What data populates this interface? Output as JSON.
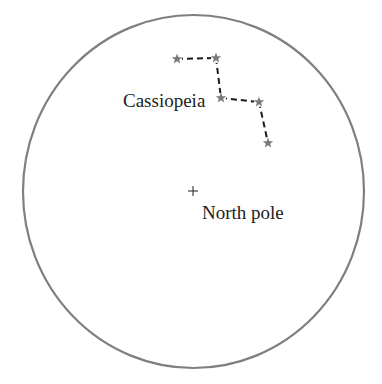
{
  "diagram": {
    "sky_circle": {
      "cx": 193.5,
      "cy": 191.5,
      "rx": 170.5,
      "ry": 176.5,
      "stroke": "#7f7f7f",
      "stroke_width": 2.2
    },
    "constellation": {
      "name": "Cassiopeia",
      "label_x": 123,
      "label_y": 107,
      "star_color": "#7a7a7a",
      "line_color": "#1a1a1a",
      "stars": [
        {
          "id": "star-1",
          "x": 177,
          "y": 59
        },
        {
          "id": "star-2",
          "x": 216,
          "y": 58
        },
        {
          "id": "star-3",
          "x": 221,
          "y": 98
        },
        {
          "id": "star-4",
          "x": 259,
          "y": 102
        },
        {
          "id": "star-5",
          "x": 268,
          "y": 143
        }
      ]
    },
    "pole": {
      "label": "North pole",
      "marker": "+",
      "marker_x": 193,
      "marker_y": 191,
      "label_x": 202,
      "label_y": 219
    }
  }
}
